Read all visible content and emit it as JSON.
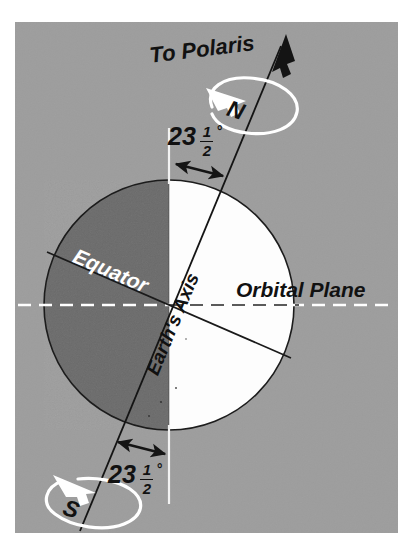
{
  "figure": {
    "panel": {
      "background_color": "#9d9d9d",
      "x": 15,
      "y": 22,
      "width": 383,
      "height": 511
    },
    "page_background_color": "#ffffff"
  },
  "earth": {
    "center_x": 169,
    "center_y": 305,
    "radius": 125,
    "night_side_color": "#6b6b6b",
    "day_side_color": "#fdfdfd",
    "outline_color": "#1a1a1a",
    "terminator_note": "vertical line through sphere center separating night (left) and day (right)"
  },
  "labels": {
    "to_polaris": "To Polaris",
    "north_pole": "N",
    "south_pole": "S",
    "equator": "Equator",
    "earths_axis": "Earth's Axis",
    "orbital_plane": "Orbital Plane",
    "tilt_top": {
      "whole": "23",
      "numerator": "1",
      "denominator": "2",
      "degree": "°"
    },
    "tilt_bottom": {
      "whole": "23",
      "numerator": "1",
      "denominator": "2",
      "degree": "°"
    }
  },
  "values": {
    "axial_tilt_degrees": 23.5,
    "axial_tilt_text": "23 1/2°",
    "rotation_direction": "counterclockwise viewed from north"
  },
  "colors": {
    "panel_gray": "#9d9d9d",
    "night_gray": "#6b6b6b",
    "day_white": "#fdfdfd",
    "line_black": "#141414",
    "accent_white": "#ffffff",
    "text_black": "#111111",
    "text_white": "#ffffff"
  },
  "elements": {
    "polaris_arrow": "arrow pointing up-right toward Polaris along Earth's axis",
    "north_rotation_ellipse": "white ellipse with arrowhead showing rotation at north pole",
    "south_rotation_ellipse": "white ellipse with arrowhead showing rotation at south pole",
    "orbital_plane_line": "white dashed horizontal line through Earth's center",
    "equator_line": "black line tilted 23.5 degrees through Earth's center",
    "tilt_arrow_top": "double-headed arrow between vertical reference and axis above the globe",
    "tilt_arrow_bottom": "double-headed arrow between axis and vertical reference below the globe",
    "vertical_reference_top": "short white vertical reference line above the globe",
    "vertical_reference_bottom": "short white vertical reference line below the globe"
  }
}
